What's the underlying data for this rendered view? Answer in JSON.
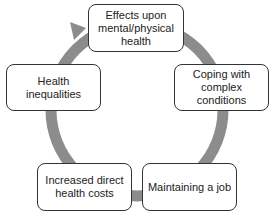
{
  "diagram": {
    "type": "cycle",
    "ring_color": "#8c8c8c",
    "nodes": [
      {
        "id": "top",
        "label": "Effects upon mental/physical health"
      },
      {
        "id": "right",
        "label": "Coping with complex conditions"
      },
      {
        "id": "bottom-right",
        "label": "Maintaining a job"
      },
      {
        "id": "bottom-left",
        "label": "Increased direct health costs"
      },
      {
        "id": "left",
        "label": "Health inequalities"
      }
    ]
  }
}
